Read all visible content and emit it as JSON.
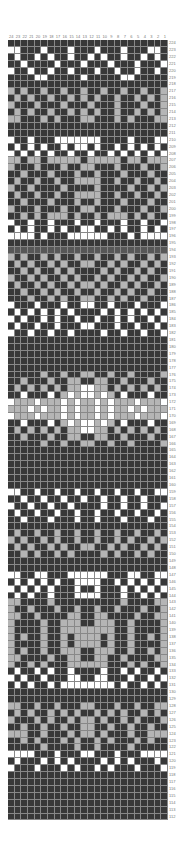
{
  "chart": {
    "columns": [
      "24",
      "23",
      "22",
      "21",
      "20",
      "19",
      "18",
      "17",
      "16",
      "15",
      "14",
      "13",
      "12",
      "11",
      "10",
      "9",
      "8",
      "7",
      "6",
      "5",
      "4",
      "3",
      "2",
      "1"
    ],
    "first_row": 224,
    "last_row": 112,
    "palette": {
      "K": "#383838",
      "D": "#575757",
      "G": "#b5b5b5",
      "W": "#ffffff"
    },
    "rows": [
      "KKKKKKKKKKKKKKKKKKKKKKKK",
      "WWKKKWKKKWKKKWKKKWKKKWWK",
      "KWKKWKWKKWKKWKWKKWKKWKWK",
      "KKWKKKKWKKKWKKKWKKKWKKKW",
      "WKKWKKWKKWKKKWKKWKKWKKWK",
      "KKKKWWKKKKKWKKKKKWWKKKKK",
      "KKKKKKKKKKKKKKKKKKKKKKKK",
      "GKGKKGKKGKKGKKGKKGKKGKKG",
      "KGKGKKGKKGKGKGKKGKKGKGKG",
      "GKKKGKKKGKKKGKKKGKKKGKKG",
      "KGKGKKGKKGKGKGKKGKKGKGKG",
      "GGKKKGKGKKKGGKKKGKGKKKGG",
      "KKKKKKKKKKKKKKKKKKKKKKKK",
      "KKKKKKKKKKKKKKKKKKKKKKKK",
      "WKKWKKKWWWWWWWKKKKWKKKWW",
      "KWKWKWKKWKWWKWKKWKWKWKWK",
      "WKWKWKWKKWKKWKKWKWKWKWKW",
      "GGKGGKGGGGGKGGGGGKGGKGGG",
      "GKKKGKKKGKKGGKKKGKKKGKKG",
      "KKGKKKGKKKGKKGKKKGKKKGKK",
      "KGKKGKKGKKGGGGKKGKKGKKGK",
      "GKKGKKKKGKKKKGKKKKGKKGKG",
      "KGKKGKKGKKGGGGKKGKKGKKGK",
      "KKGKKKGKKKGKKGKKKGKKKGKK",
      "GKKKGKKKGKKGGKKKGKKKGKKG",
      "KKGKGKGGGKGKKGKGGGKGKGKK",
      "WKKWKKWKKKWKKWKKKWKKWKKW",
      "KWKWKKWKWKKWWKKWKWKKWKWK",
      "WWWWKWKKKWWWWWWKKKWKWWWW",
      "KKKKKKKKKKKKKKKKKKKKKKKK",
      "DDDDDDDDDDDDDDDDDDDDDDDD",
      "GKGKKGKGKKGKKGKKGKGKKGKG",
      "KGKGKKGKGKKGGKKGKGKKGKGK",
      "KKGKGKKGKGKKKKGKGKKGKGKK",
      "GKKGKGKKGKGKKGKGKKGKGKKG",
      "KGKKGKGKKGKGGKGKKGKGKKGK",
      "KKGKKGKGKKGKKGKKGKGKKGKK",
      "KKKGKKGKGKKGGKKGKGKKGKKK",
      "WKKKWKKKWKKWWKKWKKKWKKKW",
      "KWKWKWKWKWKKKKWKWKWKWKWK",
      "WKWKKWKWKKWKKWKKWKWKKWKW",
      "KWKKWKKWKKKWWKKKWKKWKKWK",
      "WKKWKKWKKWKKKKWKKWKKWKKW",
      "KKKKKKKKKKKKKKKKKKKKKKKK",
      "KKKKKKKKKKKKKKKKKKKKKKKK",
      "KKKKKKKKKKKKKKKKKKKKKKKK",
      "KKKKKKKKKKKKKKKKKKKKKKKK",
      "KKKKKKKKKKKKKKKKKKKKKKKK",
      "KKKKKGKKGKKGGKKGKKGKKKKG",
      "KKGKKKGKKGGKKGGKKGKKKGKK",
      "KGKGKGKGKGGWWGGKGKGKGKGK",
      "KKWKKKWKGWGWWGWGKWKKKWKK",
      "WGGGWGGGWGWGGWGWGGGWGGGW",
      "GGGWGWGGWGWGGWGWGGWGWGGG",
      "WGGGWGGGWGWGGWGWGGGWGGGW",
      "KKWKKKWKGWGWWGWGKWKKKWKK",
      "KGKGKGKGKGGWWGGKGKGKGKGK",
      "KKGKKKGKKGGKKGGKKGKKKGKK",
      "KKKKKGKKGKKGGKKGKKGKKKKG",
      "KKKKKKKKKKKKKKKKKKKKKKKK",
      "KKKKKKKKKKKKKKKKKKKKKKKK",
      "KKKKKKKKKKKKKKKKKKKKKKKK",
      "KKKKKKKKKKKKKKKKKKKKKKKK",
      "KKKKKKKKKKKKKKKKKKKKKKKK",
      "KKKKKKKKKKKKKKKKKKKKKKKK",
      "WWKKWKKWKKWKKWKKWKKWKKWW",
      "KKWKKWKKWKKWKKWKKWKKWKKK",
      "WKKWKKWKKWKKKKWKKWKKWKKW",
      "KWKKWKKWKKWKKWKKWKKWKKWK",
      "KKWKKKWKKKWKKWKKKWKKKWKK",
      "KKKKKKKKKKKKKKKKKKKKKKKK",
      "KGKKGKKGKKGKKGKKGKKGKKGK",
      "GKGKKGKGKKGKKGKKGKGKKGKG",
      "KGKGKKGKGKKGGKKGKGKKGKGK",
      "KKGKGKKGKGKKKKGKGKKGKGKK",
      "KKKKKKKKKKKKKKKKKKKKKKKK",
      "KKKKKKKKKKKKKKKKKKKKKKKK",
      "WWKKWWKKKWWWWWWKKKWWKKWW",
      "KWKWKWKWKKWWWWKKWKWKWKWK",
      "WKWKWKWKKKWKKWKKKWKWKWKW",
      "KWKWKKWKKKWWWWKKKWKKWKWK",
      "GGKKKKGKKKKKKKKKKGKKKKGG",
      "GKKGKKKGKKGKKGKKGKKKGKKG",
      "GGKKGKKKKGGKKGGKKKKGKKGG",
      "GKKKKGKKGGGKKGGGKKGKKKKG",
      "GKKKKGKKGGGGGGGGKKGKKKKG",
      "GKGKKGKKGKGGGGKGKKGKKGKG",
      "GKKKKGKKGKGGGGKGKKGKKKKG",
      "GKGKKGKKGGGKKGGGKKGKKGKG",
      "GGKKKKGKKGGKKGGKKGKKKKGG",
      "GKKGKGKKKGGGGGGKKKGKGKKG",
      "KWKKWKWKKWKKKKWKKWKWKKWK",
      "WKWKKWKKKWWKKWWKKKWKKWKW",
      "KWKWKKWKWWWWWWWWKWKKWKWK",
      "KKKKKKKKKKKKKKKKKKKKKKKK",
      "KKKKKKKKKKKKKKKKKKKKKKKK",
      "GGKKGKKGKKKGGKKKGKKGKKGG",
      "KGKGKKGKGKGKKGKGKGKKGKGK",
      "GKKKGKGKKGKGGKGKKGKGKKKG",
      "KKGKKGKKGKKGGKKGKKGKKGKK",
      "GGGKKGKKKGKGGKGKKKGKKGGG",
      "KKGKGKKKGKGKKGKGKKKGKGKK",
      "KKKKKGKKKKGKKGKKKKGKKKKK",
      "WWWWKKKWKKKWWKKKWKKKWWWW",
      "KWKKKWKWKWKKKKWKWKWKKKWK",
      "WKKKWKKKWKWKKWKWKKKWKKKW",
      "KKKKKKKKKKKKKKKKKKKKKKKK",
      "KKKKKKKKKKKKKKKKKKKKKKKK",
      "KKKKKKKKKKKKKKKKKKKKKKKK",
      "KKKKKKKKKKKKKKKKKKKKKKKK",
      "KKKKKKKKKKKKKKKKKKKKKKKK",
      "KKKKKKKKKKKKKKKKKKKKKKKK"
    ]
  }
}
